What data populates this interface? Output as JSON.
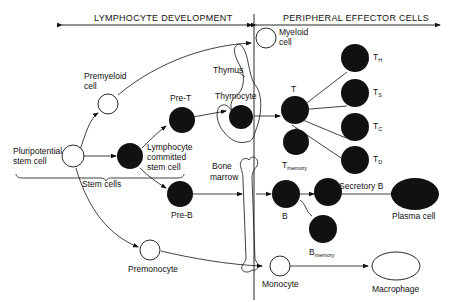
{
  "header": {
    "left_section": "LYMPHOCYTE DEVELOPMENT",
    "right_section": "PERIPHERAL EFFECTOR CELLS"
  },
  "cells": {
    "pluripotential": {
      "line1": "Pluripotential",
      "line2": "stem cell",
      "fill": "white"
    },
    "premyeloid": {
      "line1": "Premyeloid",
      "line2": "cell",
      "fill": "white"
    },
    "myeloid": {
      "line1": "Myeloid",
      "line2": "cell",
      "fill": "white"
    },
    "lymphocyte_committed": {
      "line1": "Lymphocyte",
      "line2": "committed",
      "line3": "stem cell",
      "fill": "black"
    },
    "pre_t": {
      "label": "Pre-T",
      "fill": "black"
    },
    "pre_b": {
      "label": "Pre-B",
      "fill": "black"
    },
    "thymocyte": {
      "label": "Thymocyte",
      "fill": "black"
    },
    "t_cell": {
      "label": "T",
      "fill": "black"
    },
    "t_memory": {
      "label": "T",
      "sub": "memory",
      "fill": "black"
    },
    "t_h": {
      "label": "T",
      "sub": "H",
      "fill": "black"
    },
    "t_s": {
      "label": "T",
      "sub": "S",
      "fill": "black"
    },
    "t_c": {
      "label": "T",
      "sub": "C",
      "fill": "black"
    },
    "t_d": {
      "label": "T",
      "sub": "D",
      "fill": "black"
    },
    "b_cell": {
      "label": "B",
      "fill": "black"
    },
    "secretory_b": {
      "label": "Secretory B",
      "fill": "black"
    },
    "b_memory": {
      "label": "B",
      "sub": "memory",
      "fill": "black"
    },
    "plasma": {
      "label": "Plasma cell",
      "fill": "black"
    },
    "premonocyte": {
      "label": "Premonocyte",
      "fill": "white"
    },
    "monocyte": {
      "label": "Monocyte",
      "fill": "white"
    },
    "macrophage": {
      "label": "Macrophage",
      "fill": "white"
    }
  },
  "organs": {
    "thymus": "Thymus",
    "bone_marrow_line1": "Bone",
    "bone_marrow_line2": "marrow"
  },
  "groups": {
    "stem_cells": "Stem cells"
  },
  "colors": {
    "ink": "#111111",
    "background": "#ffffff"
  }
}
